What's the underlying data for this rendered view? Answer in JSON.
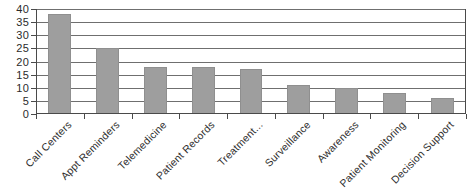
{
  "chart_data": {
    "type": "bar",
    "title": "",
    "subtitle": "",
    "xlabel": "",
    "ylabel": "",
    "categories": [
      "Call Centers",
      "Appt Reminders",
      "Telemedicine",
      "Patient Records",
      "Treatment...",
      "Surveillance",
      "Awareness",
      "Patient Monitoring",
      "Decision Support"
    ],
    "values": [
      38,
      25,
      18,
      18,
      17,
      11,
      10,
      8,
      6
    ],
    "ylim": [
      0,
      40
    ],
    "yticks": [
      0,
      5,
      10,
      15,
      20,
      25,
      30,
      35,
      40
    ],
    "ytick_labels": [
      "0",
      "5",
      "10",
      "15",
      "20",
      "25",
      "30",
      "35",
      "40"
    ],
    "grid": true,
    "grid_axis": "y",
    "legend": false,
    "legend_position": "none",
    "bar_color": "#9e9e9e",
    "grid_color": "#6f6f6f",
    "axis_color": "#4a4a4a",
    "background_color": "#ffffff",
    "xtick_label_rotation": -45
  }
}
